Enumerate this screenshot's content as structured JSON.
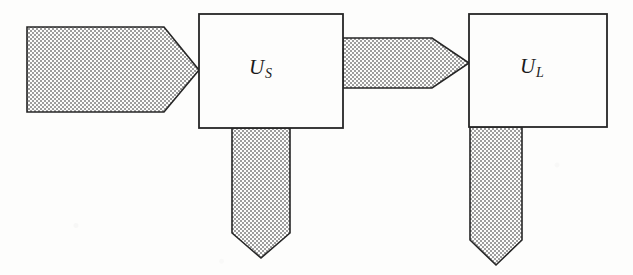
{
  "diagram": {
    "type": "block-flow-diagram",
    "background_color": "#fdfdfc",
    "stroke_color": "#262626",
    "fill_pattern": "checkerboard-dither-gray",
    "fill_color": "#a8a8a8",
    "boxes": [
      {
        "name": "u-s",
        "label_base": "U",
        "label_sub": "S",
        "x": 199,
        "y": 14,
        "width": 144,
        "height": 114
      },
      {
        "name": "u-l",
        "label_base": "U",
        "label_sub": "L",
        "x": 469,
        "y": 14,
        "width": 138,
        "height": 113
      }
    ],
    "arrows": [
      {
        "name": "input-arrow",
        "direction": "right",
        "points": "27,27 164,27 199,70 164,112 27,112"
      },
      {
        "name": "us-to-ul-arrow",
        "direction": "right",
        "points": "343,38 432,38 469,63 432,88 343,88"
      },
      {
        "name": "us-output-arrow",
        "direction": "down",
        "points": "232,128 290,128 290,233 261,258 232,233"
      },
      {
        "name": "ul-output-arrow",
        "direction": "down",
        "points": "470,127 522,127 522,240 496,265 470,240"
      }
    ]
  }
}
